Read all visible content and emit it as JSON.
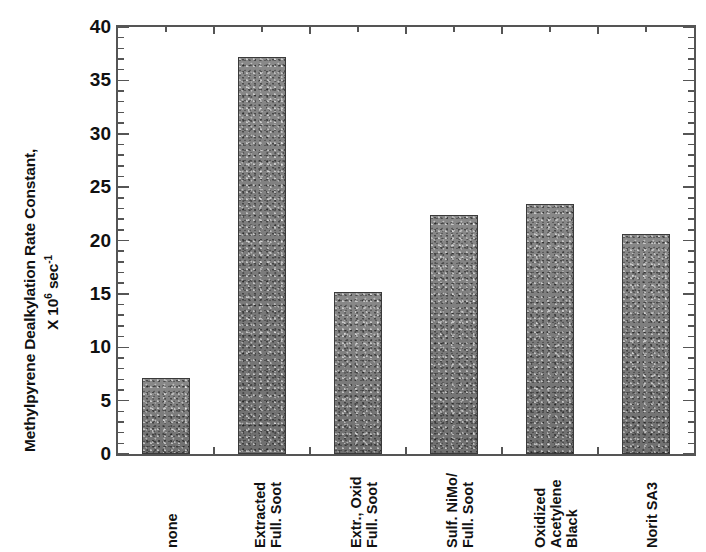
{
  "chart_data": {
    "type": "bar",
    "title": "",
    "subtitle": "",
    "xlabel": "",
    "ylabel": "Methylpyrene Dealkylation Rate Constant, X 10⁶ sec⁻¹",
    "ylabel_line1": "Methylpyrene Dealkylation Rate Constant,",
    "ylabel_line2_prefix": "X 10",
    "ylabel_line2_exp": "6",
    "ylabel_line2_mid": " sec",
    "ylabel_line2_sup": "-1",
    "categories": [
      "none",
      "Extracted Full. Soot",
      "Extr., Oxid Full. Soot",
      "Sulf. NiMo/ Full. Soot",
      "Oxidized Acetylene Black",
      "Norit SA3"
    ],
    "category_lines": [
      [
        "none"
      ],
      [
        "Extracted",
        "Full. Soot"
      ],
      [
        "Extr., Oxid",
        "Full. Soot"
      ],
      [
        "Sulf. NiMo/",
        "Full. Soot"
      ],
      [
        "Oxidized",
        "Acetylene",
        "Black"
      ],
      [
        "Norit SA3"
      ]
    ],
    "values": [
      7.1,
      37.2,
      15.2,
      22.4,
      23.4,
      20.6
    ],
    "ylim": [
      0,
      40
    ],
    "ytick_labels": [
      "0",
      "5",
      "10",
      "15",
      "20",
      "25",
      "30",
      "35",
      "40"
    ],
    "ytick_values": [
      0,
      5,
      10,
      15,
      20,
      25,
      30,
      35,
      40
    ],
    "ytick_minor_step": 1,
    "grid": false,
    "legend": "none",
    "bar_color": "#7c7c7c",
    "bar_edge_color": "#3a3a3a",
    "axis_color": "#555555",
    "text_color": "#111111",
    "background_color": "#ffffff"
  }
}
